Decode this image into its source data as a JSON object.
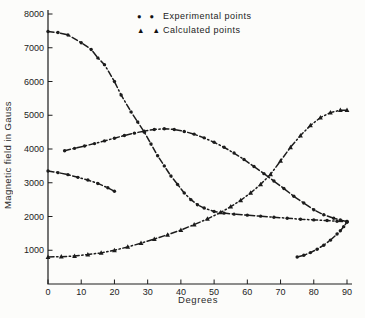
{
  "figure": {
    "background": "#fcfcfa",
    "ink": "#1c1c1c"
  },
  "legend": {
    "items": [
      {
        "label": "Experimental points",
        "marker": "circle",
        "glyph": "● ●"
      },
      {
        "label": "Calculated points",
        "marker": "triangle",
        "glyph": "▲ ▲"
      }
    ]
  },
  "chart_data": {
    "type": "line",
    "title": "",
    "xlabel": "Degrees",
    "ylabel": "Magnetic field in Gauss",
    "xlim": [
      0,
      90
    ],
    "ylim": [
      0,
      8000
    ],
    "xticks": [
      0,
      10,
      20,
      30,
      40,
      50,
      60,
      70,
      80,
      90
    ],
    "yticks": [
      1000,
      2000,
      3000,
      4000,
      5000,
      6000,
      7000,
      8000
    ],
    "grid": false,
    "legend_position": "top-center",
    "line_style": "dash-dot chain line",
    "series": [
      {
        "id": "exp-upper-descending",
        "name": "Experimental points (upper branch, descends then flattens)",
        "marker": "circle",
        "points": [
          [
            0,
            7480
          ],
          [
            3,
            7450
          ],
          [
            6,
            7380
          ],
          [
            10,
            7150
          ],
          [
            13,
            6950
          ],
          [
            15,
            6700
          ],
          [
            17,
            6500
          ],
          [
            20,
            6000
          ],
          [
            22,
            5600
          ],
          [
            25,
            5100
          ],
          [
            27,
            4800
          ],
          [
            29,
            4500
          ],
          [
            31,
            4150
          ],
          [
            33,
            3800
          ],
          [
            35,
            3500
          ],
          [
            37,
            3200
          ],
          [
            39,
            2950
          ],
          [
            41,
            2700
          ],
          [
            43,
            2500
          ],
          [
            45,
            2350
          ],
          [
            47,
            2250
          ],
          [
            50,
            2150
          ],
          [
            53,
            2100
          ],
          [
            56,
            2070
          ],
          [
            60,
            2040
          ],
          [
            64,
            2010
          ],
          [
            68,
            1980
          ],
          [
            72,
            1950
          ],
          [
            76,
            1920
          ],
          [
            80,
            1900
          ],
          [
            84,
            1880
          ],
          [
            87,
            1860
          ],
          [
            90,
            1850
          ]
        ]
      },
      {
        "id": "exp-hump",
        "name": "Experimental points (middle branch, peaks near 35 deg)",
        "marker": "circle",
        "points": [
          [
            5,
            3950
          ],
          [
            8,
            4020
          ],
          [
            11,
            4090
          ],
          [
            14,
            4160
          ],
          [
            17,
            4240
          ],
          [
            20,
            4320
          ],
          [
            23,
            4400
          ],
          [
            26,
            4470
          ],
          [
            29,
            4530
          ],
          [
            32,
            4580
          ],
          [
            35,
            4600
          ],
          [
            38,
            4580
          ],
          [
            41,
            4520
          ],
          [
            44,
            4440
          ],
          [
            47,
            4330
          ],
          [
            50,
            4200
          ],
          [
            53,
            4050
          ],
          [
            56,
            3880
          ],
          [
            59,
            3690
          ],
          [
            62,
            3480
          ],
          [
            65,
            3270
          ],
          [
            68,
            3050
          ],
          [
            71,
            2830
          ],
          [
            74,
            2600
          ],
          [
            77,
            2400
          ],
          [
            80,
            2200
          ],
          [
            83,
            2050
          ],
          [
            86,
            1950
          ],
          [
            88,
            1900
          ],
          [
            90,
            1850
          ]
        ]
      },
      {
        "id": "exp-lower-left",
        "name": "Experimental points (short lower-left branch)",
        "marker": "circle",
        "points": [
          [
            0,
            3350
          ],
          [
            3,
            3300
          ],
          [
            6,
            3240
          ],
          [
            9,
            3160
          ],
          [
            12,
            3080
          ],
          [
            15,
            2980
          ],
          [
            18,
            2850
          ],
          [
            20,
            2750
          ]
        ]
      },
      {
        "id": "calc-rising",
        "name": "Calculated points (rising branch)",
        "marker": "triangle",
        "points": [
          [
            0,
            800
          ],
          [
            4,
            810
          ],
          [
            8,
            830
          ],
          [
            12,
            870
          ],
          [
            16,
            920
          ],
          [
            20,
            1000
          ],
          [
            24,
            1100
          ],
          [
            28,
            1210
          ],
          [
            32,
            1330
          ],
          [
            36,
            1460
          ],
          [
            40,
            1600
          ],
          [
            44,
            1760
          ],
          [
            48,
            1930
          ],
          [
            52,
            2120
          ],
          [
            55,
            2290
          ],
          [
            58,
            2480
          ],
          [
            61,
            2700
          ],
          [
            64,
            2950
          ],
          [
            67,
            3250
          ],
          [
            70,
            3650
          ],
          [
            73,
            4050
          ],
          [
            76,
            4400
          ],
          [
            79,
            4700
          ],
          [
            82,
            4930
          ],
          [
            85,
            5080
          ],
          [
            88,
            5150
          ],
          [
            90,
            5150
          ]
        ]
      },
      {
        "id": "exp-hook-lower-right",
        "name": "Experimental points (lower-right hook branch)",
        "marker": "circle",
        "points": [
          [
            75,
            800
          ],
          [
            77,
            850
          ],
          [
            79,
            930
          ],
          [
            81,
            1030
          ],
          [
            83,
            1150
          ],
          [
            85,
            1300
          ],
          [
            87,
            1480
          ],
          [
            88,
            1580
          ],
          [
            89,
            1700
          ],
          [
            90,
            1830
          ]
        ]
      }
    ]
  }
}
